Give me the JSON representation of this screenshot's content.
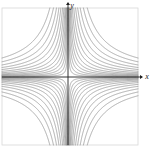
{
  "figure": {
    "title": "",
    "background_color": "#ffffff",
    "width": 155,
    "height": 155
  },
  "axes": {
    "x_label": "x",
    "y_label": "y",
    "axis_color": "#1f1f1f",
    "arrow_x_name": "x-axis-arrow",
    "arrow_y_name": "y-axis-arrow",
    "origin_x": 68,
    "origin_y": 77
  },
  "frame": {
    "border_color": "#d8d8d8",
    "left": 2,
    "top": 8,
    "right": 138,
    "bottom": 145
  },
  "chart_data": {
    "type": "line",
    "title": "",
    "xlabel": "x",
    "ylabel": "y",
    "grid": false,
    "legend": null,
    "curve_color": "#8a8a8a",
    "curve_width": 0.7,
    "xlim": [
      -3.3,
      3.3
    ],
    "ylim": [
      -3.3,
      3.3
    ],
    "contour_levels": [
      0.04,
      0.09,
      0.16,
      0.25,
      0.36,
      0.5,
      0.68,
      0.9,
      1.18,
      1.5,
      1.9,
      2.4,
      3.0
    ],
    "series": [
      {
        "name": "quadrant-2-contours",
        "quadrant": "upper-left",
        "sign_x": -1,
        "sign_y": 1,
        "count": 13
      },
      {
        "name": "quadrant-1-contours",
        "quadrant": "upper-right",
        "sign_x": 1,
        "sign_y": 1,
        "count": 13
      },
      {
        "name": "quadrant-3-contours",
        "quadrant": "lower-left",
        "sign_x": -1,
        "sign_y": -1,
        "count": 13
      },
      {
        "name": "quadrant-4-contours",
        "quadrant": "lower-right",
        "sign_x": 1,
        "sign_y": -1,
        "count": 13
      }
    ]
  }
}
